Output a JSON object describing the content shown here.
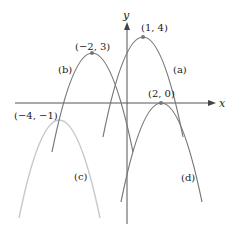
{
  "figure": {
    "axes": {
      "x_label": "x",
      "y_label": "y"
    },
    "curves": [
      {
        "id": "a",
        "label": "(a)",
        "vertex": [
          1,
          4
        ],
        "vertex_label": "(1, 4)",
        "color": "#777777"
      },
      {
        "id": "b",
        "label": "(b)",
        "vertex": [
          -2,
          3
        ],
        "vertex_label": "(−2, 3)",
        "color": "#777777"
      },
      {
        "id": "c",
        "label": "(c)",
        "vertex": [
          -4,
          -1
        ],
        "vertex_label": "(−4, −1)",
        "color": "#c8c8c8"
      },
      {
        "id": "d",
        "label": "(d)",
        "vertex": [
          2,
          0
        ],
        "vertex_label": "(2, 0)",
        "color": "#777777"
      }
    ]
  }
}
